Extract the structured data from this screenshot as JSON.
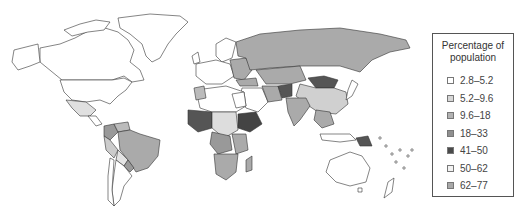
{
  "legend": {
    "title_line1": "Percentage of",
    "title_line2": "population",
    "items": [
      {
        "label": "2.8–5.2",
        "color": "#ffffff"
      },
      {
        "label": "5.2–9.6",
        "color": "#d6d6d6"
      },
      {
        "label": "9.6–18",
        "color": "#b2b2b2"
      },
      {
        "label": "18–33",
        "color": "#8f8f8f"
      },
      {
        "label": "41–50",
        "color": "#4a4a4a"
      },
      {
        "label": "50–62",
        "color": "#f2f2f2"
      },
      {
        "label": "62–77",
        "color": "#a8a8a8"
      }
    ]
  },
  "map": {
    "outline_color": "#333333",
    "type": "choropleth world map"
  }
}
